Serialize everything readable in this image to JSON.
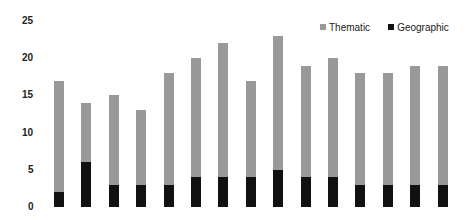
{
  "chart_data": {
    "type": "bar",
    "stacked": true,
    "title": "",
    "xlabel": "",
    "ylabel": "",
    "ylim": [
      0,
      25
    ],
    "yticks": [
      0,
      5,
      10,
      15,
      20,
      25
    ],
    "grid": false,
    "legend_position": "top-right",
    "categories": [
      "1",
      "2",
      "3",
      "4",
      "5",
      "6",
      "7",
      "8",
      "9",
      "10",
      "11",
      "12",
      "13",
      "14",
      "15"
    ],
    "category_labels_visible": false,
    "series": [
      {
        "name": "Geographic",
        "color": "#111111",
        "values": [
          2,
          6,
          3,
          3,
          3,
          4,
          4,
          4,
          5,
          4,
          4,
          3,
          3,
          3,
          3
        ]
      },
      {
        "name": "Thematic",
        "color": "#999999",
        "values": [
          15,
          8,
          12,
          10,
          15,
          16,
          18,
          13,
          18,
          15,
          16,
          15,
          15,
          16,
          16
        ]
      }
    ],
    "totals": [
      17,
      14,
      15,
      13,
      18,
      20,
      22,
      17,
      23,
      19,
      20,
      18,
      18,
      19,
      19
    ]
  },
  "legend": {
    "items": [
      {
        "label": "Thematic",
        "color": "#999999"
      },
      {
        "label": "Geographic",
        "color": "#111111"
      }
    ]
  }
}
